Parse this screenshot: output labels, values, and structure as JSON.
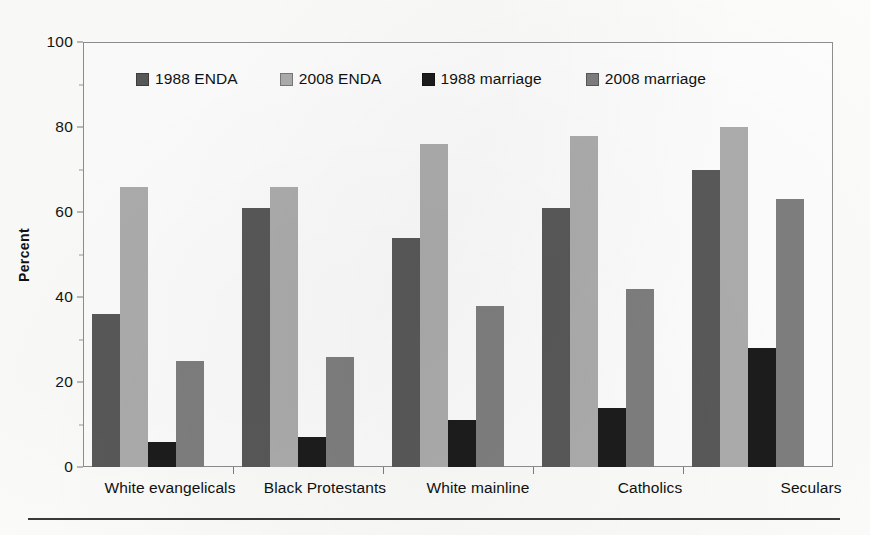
{
  "chart_data": {
    "type": "bar",
    "title": "",
    "subtitle": "",
    "xlabel": "",
    "ylabel": "Percent",
    "ylim": [
      0,
      100
    ],
    "ytick_step": 20,
    "yminor_step": 10,
    "ytick_labels": [
      "0",
      "20",
      "40",
      "60",
      "80",
      "100"
    ],
    "grid": false,
    "legend_position": "top-center-inside",
    "categories": [
      "White evangelicals",
      "Black Protestants",
      "White mainline",
      "Catholics",
      "Seculars"
    ],
    "series": [
      {
        "name": "1988 ENDA",
        "color": "#595959",
        "values": [
          36,
          61,
          54,
          61,
          70
        ]
      },
      {
        "name": "2008 ENDA",
        "color": "#adadad",
        "values": [
          66,
          66,
          76,
          78,
          80
        ]
      },
      {
        "name": "1988 marriage",
        "color": "#1c1c1c",
        "values": [
          6,
          7,
          11,
          14,
          28
        ]
      },
      {
        "name": "2008 marriage",
        "color": "#7f7f7f",
        "values": [
          25,
          26,
          38,
          42,
          63
        ]
      }
    ]
  },
  "axes": {
    "y_title": "Percent"
  },
  "legend": {
    "entries": [
      {
        "label": "1988 ENDA",
        "color": "#595959"
      },
      {
        "label": "2008 ENDA",
        "color": "#adadad"
      },
      {
        "label": "1988 marriage",
        "color": "#1c1c1c"
      },
      {
        "label": "2008 marriage",
        "color": "#7f7f7f"
      }
    ]
  }
}
